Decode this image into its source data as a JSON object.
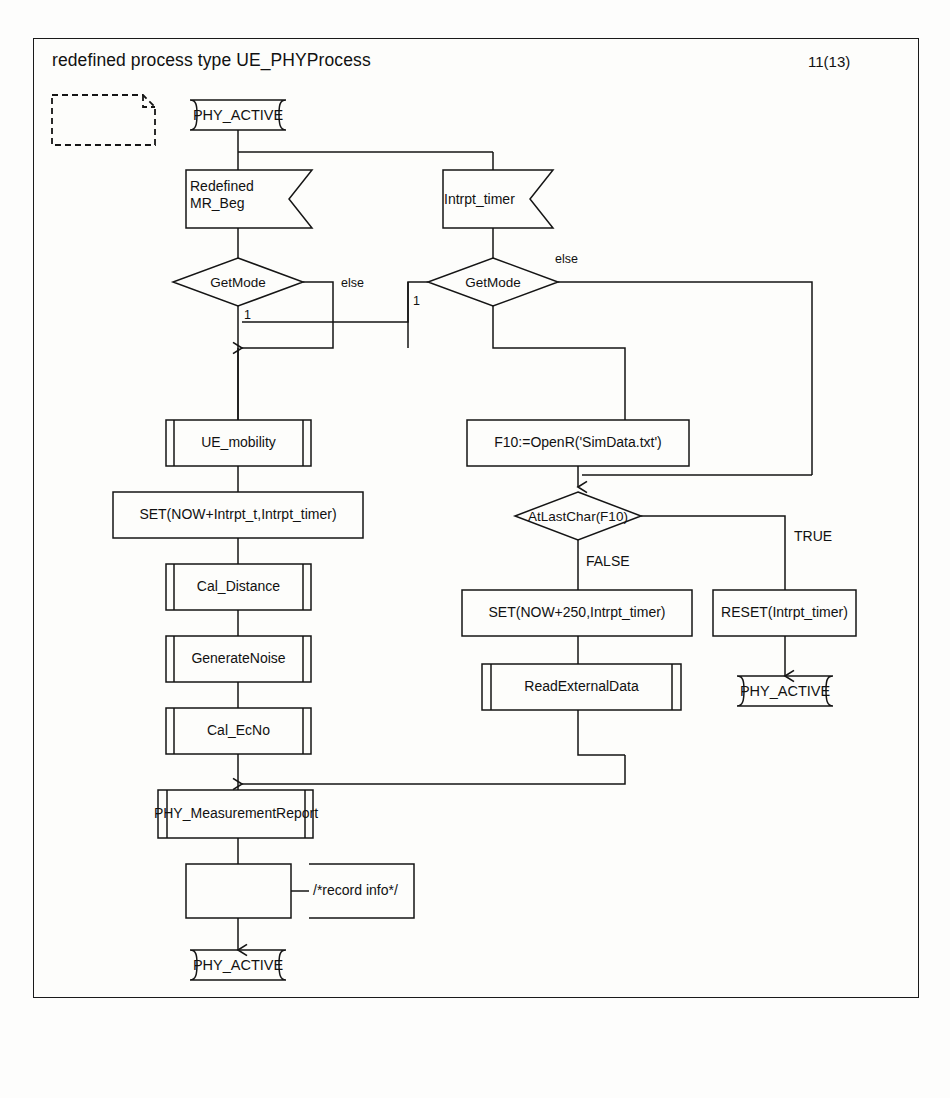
{
  "diagram": {
    "kind": "SDL process diagram",
    "title": "redefined process type UE_PHYProcess",
    "page_number": "11(13)",
    "start_state": "PHY_ACTIVE",
    "nodes": {
      "page_ref_box": "",
      "start_state": "PHY_ACTIVE",
      "input_mr_beg_line1": "Redefined",
      "input_mr_beg_line2": "MR_Beg",
      "input_intrpt_timer": "Intrpt_timer",
      "decision_getmode_left": "GetMode",
      "decision_getmode_right": "GetMode",
      "proc_ue_mobility": "UE_mobility",
      "task_set_intrpt_t": "SET(NOW+Intrpt_t,Intrpt_timer)",
      "proc_cal_distance": "Cal_Distance",
      "proc_generate_noise": "GenerateNoise",
      "proc_cal_ecno": "Cal_EcNo",
      "output_phy_measurement_report": "PHY_MeasurementReport",
      "task_record": "",
      "comment_record_info": "/*record info*/",
      "end_state_left": "PHY_ACTIVE",
      "task_openr": "F10:=OpenR('SimData.txt')",
      "decision_atlastchar": "AtLastChar(F10)",
      "task_set_250": "SET(NOW+250,Intrpt_timer)",
      "proc_read_external_data": "ReadExternalData",
      "task_reset_timer": "RESET(Intrpt_timer)",
      "end_state_right": "PHY_ACTIVE"
    },
    "edge_labels": {
      "left_else": "else",
      "left_one": "1",
      "right_else": "else",
      "right_one": "1",
      "false_branch": "FALSE",
      "true_branch": "TRUE"
    },
    "colors": {
      "stroke": "#151515",
      "text": "#111111",
      "background": "#fdfdfb",
      "page": "#ffffff"
    }
  }
}
